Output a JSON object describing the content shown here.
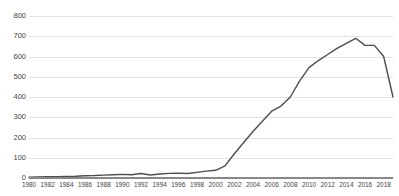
{
  "chart_data": {
    "type": "line",
    "title": "",
    "xlabel": "",
    "ylabel": "",
    "ylim": [
      0,
      800
    ],
    "xlim": [
      1980,
      2019
    ],
    "grid": true,
    "legend": "none",
    "line_color": "#4d4d4d",
    "grid_color": "#e2e2e2",
    "axis_color": "#888888",
    "y_ticks": [
      800,
      700,
      600,
      500,
      400,
      300,
      200,
      100,
      0
    ],
    "x_ticks": [
      1980,
      1982,
      1984,
      1986,
      1988,
      1990,
      1992,
      1994,
      1996,
      1998,
      2000,
      2002,
      2004,
      2006,
      2008,
      2010,
      2012,
      2014,
      2016,
      2018
    ],
    "x": [
      1980,
      1981,
      1982,
      1983,
      1984,
      1985,
      1986,
      1987,
      1988,
      1989,
      1990,
      1991,
      1992,
      1993,
      1994,
      1995,
      1996,
      1997,
      1998,
      1999,
      2000,
      2001,
      2002,
      2003,
      2004,
      2005,
      2006,
      2007,
      2008,
      2009,
      2010,
      2011,
      2012,
      2013,
      2014,
      2015,
      2016,
      2017,
      2018,
      2019
    ],
    "values": [
      4,
      5,
      6,
      7,
      8,
      9,
      11,
      12,
      14,
      16,
      18,
      16,
      22,
      15,
      20,
      23,
      24,
      22,
      28,
      34,
      38,
      60,
      120,
      175,
      230,
      280,
      330,
      355,
      400,
      480,
      545,
      580,
      610,
      640,
      665,
      690,
      655,
      655,
      600,
      400
    ]
  }
}
